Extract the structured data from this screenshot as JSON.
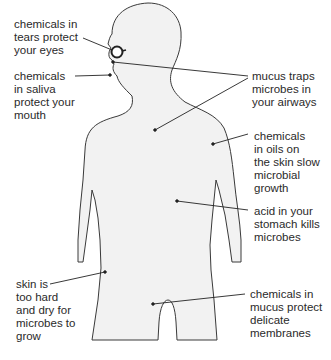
{
  "diagram": {
    "colors": {
      "body_fill": "#f2f2f2",
      "outline": "#3a3a3a",
      "text": "#2a2a2a",
      "leader": "#222222"
    },
    "labels": [
      {
        "id": "tears",
        "text": "chemicals in\ntears protect\nyour eyes",
        "target": "eye"
      },
      {
        "id": "saliva",
        "text": "chemicals\nin saliva\nprotect your\nmouth",
        "target": "mouth"
      },
      {
        "id": "mucus-airways",
        "text": "mucus traps\nmicrobes in\nyour airways",
        "target": "nose-and-chest"
      },
      {
        "id": "oils",
        "text": "chemicals\nin oils on\nthe skin slow\nmicrobial\ngrowth",
        "target": "shoulder-skin"
      },
      {
        "id": "acid",
        "text": "acid in your\nstomach kills\nmicrobes",
        "target": "stomach"
      },
      {
        "id": "skin",
        "text": "skin is\ntoo hard\nand dry for\nmicrobes to\ngrow",
        "target": "hip-skin"
      },
      {
        "id": "mucus-membranes",
        "text": "chemicals in\nmucus protect\ndelicate\nmembranes",
        "target": "groin"
      }
    ]
  }
}
